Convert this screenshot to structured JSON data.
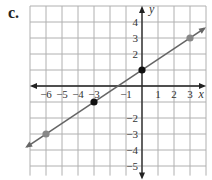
{
  "part_label": "c.",
  "chart_data": {
    "type": "line",
    "title": "",
    "xlabel": "x",
    "ylabel": "y",
    "xlim": [
      -7,
      4
    ],
    "ylim": [
      -5.5,
      5
    ],
    "grid": true,
    "x_tick_labels": [
      "-6",
      "-5",
      "-4",
      "-3",
      "-1",
      "1",
      "2",
      "3"
    ],
    "y_tick_labels": [
      "4",
      "3",
      "2",
      "-2",
      "-3",
      "-4",
      "-5"
    ],
    "line": {
      "slope": 0.6667,
      "intercept": 1,
      "equation": "y = 2/3 x + 1",
      "arrows_both_ends": true
    },
    "points": [
      {
        "x": -6,
        "y": -3,
        "color": "#888888"
      },
      {
        "x": -3,
        "y": -1,
        "color": "#111111"
      },
      {
        "x": 0,
        "y": 1,
        "color": "#111111"
      },
      {
        "x": 3,
        "y": 3,
        "color": "#888888"
      }
    ],
    "colors": {
      "grid": "#b0b0b0",
      "axes": "#222222",
      "line": "#666666"
    }
  }
}
